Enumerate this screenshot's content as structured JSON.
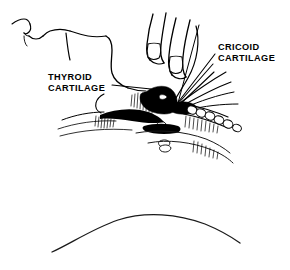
{
  "figure": {
    "kind": "medical-line-illustration",
    "background_color": "#ffffff",
    "ink_color": "#000000",
    "width": 290,
    "height": 270
  },
  "annotations": [
    {
      "id": "thyroid",
      "line1": "THYROID",
      "line2": "CARTILAGE",
      "text_x": 48,
      "text_y": 80,
      "line_height": 10.5,
      "leader": "M 112 85 L 151 89"
    },
    {
      "id": "cricoid",
      "line1": "CRICOID",
      "line2": "CARTILAGE",
      "text_x": 218,
      "text_y": 50,
      "line_height": 10.5,
      "leader_a": "M 215 54 L 176 105",
      "leader_b": "M 215 65 L 176 106",
      "leader_c": "M 216 72 L 176 107"
    }
  ],
  "parts": {
    "face_profile": "nose-lips-chin-outline",
    "neck": "neck-and-jaw-outline",
    "fingers": "two-fingers-with-nails",
    "larynx": "thyroid-and-cricoid-cartilage-shading",
    "trachea": "tracheal-rings-chain",
    "shoulder_arc": "lower-chest-arc"
  }
}
